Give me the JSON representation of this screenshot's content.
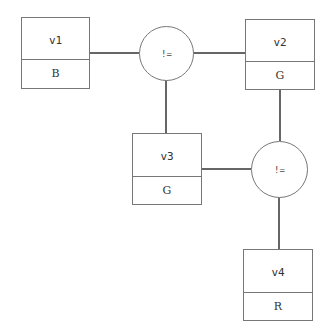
{
  "diagram": {
    "variables": [
      {
        "id": "v1",
        "name": "v1",
        "value": "B"
      },
      {
        "id": "v2",
        "name": "v2",
        "value": "G"
      },
      {
        "id": "v3",
        "name": "v3",
        "value": "G"
      },
      {
        "id": "v4",
        "name": "v4",
        "value": "R"
      }
    ],
    "constraints": [
      {
        "id": "c1",
        "label": "!=",
        "connects": [
          "v1",
          "v2",
          "v3"
        ]
      },
      {
        "id": "c2",
        "label": "!=",
        "connects": [
          "v2",
          "v3",
          "v4"
        ]
      }
    ],
    "colors": {
      "stroke": "#777777",
      "edge": "#333333",
      "text": "#333333"
    }
  }
}
